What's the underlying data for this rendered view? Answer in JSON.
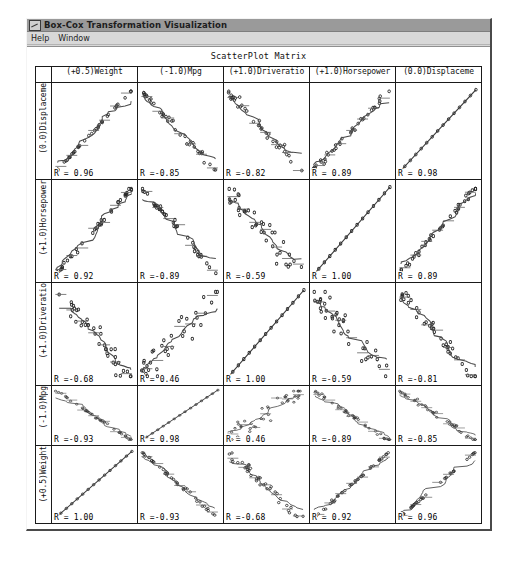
{
  "window": {
    "title": "Box-Cox Transformation Visualization",
    "menu": [
      "Help",
      "Window"
    ]
  },
  "chart_data": {
    "type": "scatter",
    "title": "ScatterPlot Matrix",
    "xlabel": "",
    "ylabel": "",
    "grid": false,
    "legend_position": "none",
    "columns": [
      "(+0.5)Weight",
      "(-1.0)Mpg",
      "(+1.0)Driveratio",
      "(+1.0)Horsepower",
      "(0.0)Displaceme"
    ],
    "rows": [
      "(0.0)Displaceme",
      "(+1.0)Horsepower",
      "(+1.0)Driveratio",
      "(-1.0)Mpg",
      "(+0.5)Weight"
    ],
    "correlation_matrix": [
      [
        "R = 0.96",
        "R =-0.85",
        "R =-0.82",
        "R = 0.89",
        "R = 0.98"
      ],
      [
        "R = 0.92",
        "R =-0.89",
        "R =-0.59",
        "R = 1.00",
        "R = 0.89"
      ],
      [
        "R =-0.68",
        "R = 0.46",
        "R = 1.00",
        "R =-0.59",
        "R =-0.81"
      ],
      [
        "R =-0.93",
        "R = 0.98",
        "R = 0.46",
        "R =-0.89",
        "R =-0.85"
      ],
      [
        "R = 1.00",
        "R =-0.93",
        "R =-0.68",
        "R = 0.92",
        "R = 0.96"
      ]
    ],
    "correlation_values": [
      [
        0.96,
        -0.85,
        -0.82,
        0.89,
        0.98
      ],
      [
        0.92,
        -0.89,
        -0.59,
        1.0,
        0.89
      ],
      [
        -0.68,
        0.46,
        1.0,
        -0.59,
        -0.81
      ],
      [
        -0.93,
        0.98,
        0.46,
        -0.89,
        -0.85
      ],
      [
        1.0,
        -0.93,
        -0.68,
        0.92,
        0.96
      ]
    ],
    "series_names": [
      "Weight",
      "Mpg",
      "Driveratio",
      "Horsepower",
      "Displacement"
    ],
    "n_points": 38,
    "overlays": [
      "lowess-smoother",
      "step-function"
    ]
  }
}
